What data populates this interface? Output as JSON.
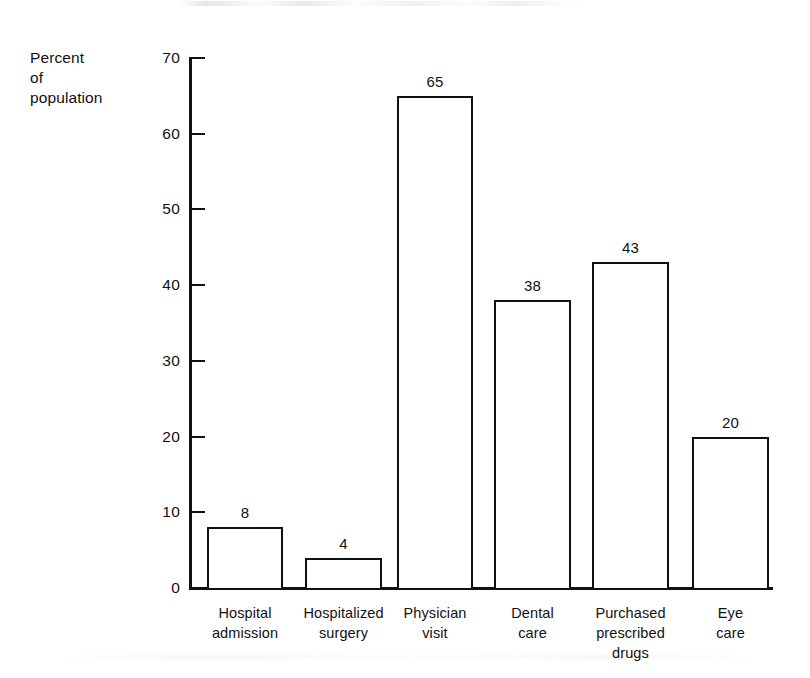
{
  "chart_data": {
    "type": "bar",
    "title": "",
    "subtitle": "",
    "xlabel": "",
    "ylabel": "Percent\nof\npopulation",
    "ylabel_lines": [
      "Percent",
      "of",
      "population"
    ],
    "categories": [
      "Hospital\nadmission",
      "Hospitalized\nsurgery",
      "Physician\nvisit",
      "Dental\ncare",
      "Purchased\nprescribed\ndrugs",
      "Eye\ncare"
    ],
    "category_lines": [
      [
        "Hospital",
        "admission"
      ],
      [
        "Hospitalized",
        "surgery"
      ],
      [
        "Physician",
        "visit"
      ],
      [
        "Dental",
        "care"
      ],
      [
        "Purchased",
        "prescribed",
        "drugs"
      ],
      [
        "Eye",
        "care"
      ]
    ],
    "values": [
      8,
      4,
      65,
      38,
      43,
      20
    ],
    "value_labels": [
      "8",
      "4",
      "65",
      "38",
      "43",
      "20"
    ],
    "ylim": [
      0,
      70
    ],
    "ytick_labels": [
      "0",
      "10",
      "20",
      "30",
      "40",
      "50",
      "60",
      "70"
    ],
    "ytick_values": [
      0,
      10,
      20,
      30,
      40,
      50,
      60,
      70
    ],
    "grid": false,
    "legend": false,
    "bar_fill_color": "#ffffff",
    "bar_edge_color": "#111111",
    "axis_color": "#111111",
    "background_color": "#ffffff"
  }
}
